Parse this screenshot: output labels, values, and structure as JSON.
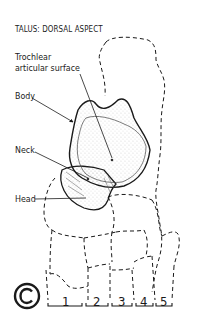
{
  "figure": {
    "title": "TALUS: DORSAL ASPECT",
    "labels": {
      "trochlear_line1": "Trochlear",
      "trochlear_line2": "articular surface",
      "body": "Body",
      "neck": "Neck",
      "head": "Head"
    },
    "metatarsal_numbers": [
      "1",
      "2",
      "3",
      "4",
      "5"
    ],
    "copyright_symbol": "©"
  },
  "colors": {
    "ink": "#1a1a1a",
    "background": "#ffffff"
  }
}
